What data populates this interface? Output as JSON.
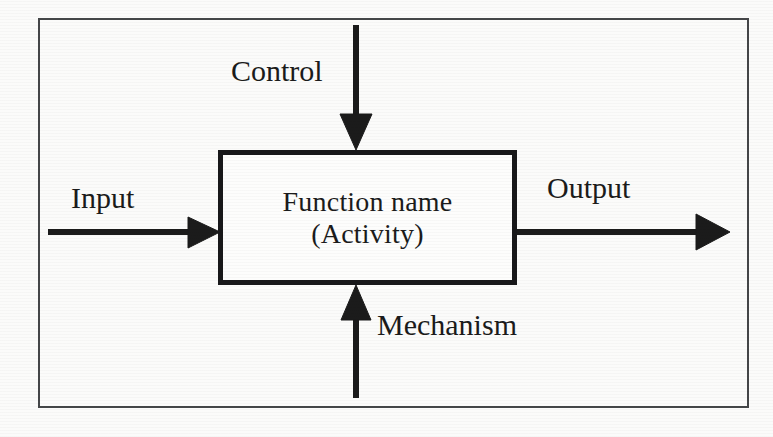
{
  "diagram": {
    "type": "IDEF0 function box (ICOM)",
    "background_color": "#fbfbfa",
    "frame_color": "#444648",
    "box_border_color": "#18181a",
    "arrow_color": "#1b1b1b"
  },
  "function_box": {
    "line1": "Function name",
    "line2": "(Activity)"
  },
  "arrows": {
    "control": {
      "label": "Control",
      "direction": "down",
      "icon": "arrow-down-icon"
    },
    "input": {
      "label": "Input",
      "direction": "right",
      "icon": "arrow-right-icon"
    },
    "output": {
      "label": "Output",
      "direction": "right",
      "icon": "arrow-right-icon"
    },
    "mechanism": {
      "label": "Mechanism",
      "direction": "up",
      "icon": "arrow-up-icon"
    }
  }
}
